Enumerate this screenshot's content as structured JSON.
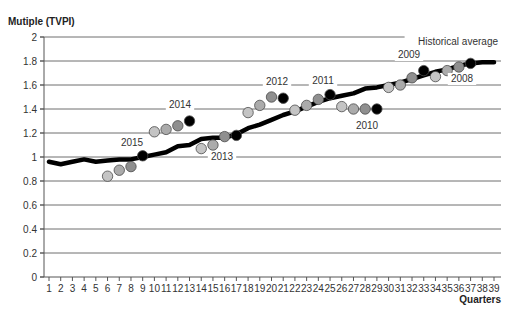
{
  "chart_data": {
    "type": "line",
    "title": "",
    "ylabel": "Mutiple (TVPI)",
    "xlabel": "Quarters",
    "ylim": [
      0,
      2
    ],
    "yticks": [
      "0",
      "0.2",
      "0.4",
      "0.6",
      "0.8",
      "1",
      "1.2",
      "1.4",
      "1.6",
      "1.8",
      "2"
    ],
    "ytick_values": [
      0,
      0.2,
      0.4,
      0.6,
      0.8,
      1.0,
      1.2,
      1.4,
      1.6,
      1.8,
      2.0
    ],
    "x": [
      1,
      2,
      3,
      4,
      5,
      6,
      7,
      8,
      9,
      10,
      11,
      12,
      13,
      14,
      15,
      16,
      17,
      18,
      19,
      20,
      21,
      22,
      23,
      24,
      25,
      26,
      27,
      28,
      29,
      30,
      31,
      32,
      33,
      34,
      35,
      36,
      37,
      38,
      39
    ],
    "grid": true,
    "series": [
      {
        "name": "Historical average",
        "style": "line",
        "color": "#000000",
        "values": [
          0.96,
          0.94,
          0.96,
          0.98,
          0.96,
          0.97,
          0.98,
          0.98,
          1.0,
          1.02,
          1.04,
          1.09,
          1.1,
          1.15,
          1.16,
          1.16,
          1.19,
          1.24,
          1.27,
          1.31,
          1.35,
          1.38,
          1.42,
          1.46,
          1.49,
          1.51,
          1.53,
          1.57,
          1.58,
          1.6,
          1.62,
          1.65,
          1.68,
          1.71,
          1.73,
          1.76,
          1.78,
          1.79,
          1.79
        ]
      },
      {
        "name": "2015",
        "style": "dots",
        "x": [
          6,
          7,
          8,
          9
        ],
        "values": [
          0.84,
          0.89,
          0.92,
          1.01
        ]
      },
      {
        "name": "2014",
        "style": "dots",
        "x": [
          10,
          11,
          12,
          13
        ],
        "values": [
          1.21,
          1.23,
          1.26,
          1.3
        ]
      },
      {
        "name": "2013",
        "style": "dots",
        "x": [
          14,
          15,
          16,
          17
        ],
        "values": [
          1.07,
          1.1,
          1.17,
          1.18
        ]
      },
      {
        "name": "2012",
        "style": "dots",
        "x": [
          18,
          19,
          20,
          21
        ],
        "values": [
          1.37,
          1.43,
          1.5,
          1.49
        ]
      },
      {
        "name": "2011",
        "style": "dots",
        "x": [
          22,
          23,
          24,
          25
        ],
        "values": [
          1.39,
          1.43,
          1.48,
          1.52
        ]
      },
      {
        "name": "2010",
        "style": "dots",
        "x": [
          26,
          27,
          28,
          29
        ],
        "values": [
          1.42,
          1.4,
          1.4,
          1.4
        ]
      },
      {
        "name": "2009",
        "style": "dots",
        "x": [
          30,
          31,
          32,
          33
        ],
        "values": [
          1.58,
          1.6,
          1.66,
          1.72
        ]
      },
      {
        "name": "2008",
        "style": "dots",
        "x": [
          34,
          35,
          36,
          37
        ],
        "values": [
          1.67,
          1.72,
          1.75,
          1.78
        ]
      }
    ],
    "dot_colors": [
      "#c4c4c4",
      "#ababab",
      "#8f8f8f",
      "#000000"
    ],
    "annotations": [
      {
        "text": "Historical average",
        "x": 458,
        "y": 45
      },
      {
        "text": "2015",
        "x": 132,
        "y": 146
      },
      {
        "text": "2014",
        "x": 180,
        "y": 108
      },
      {
        "text": "2013",
        "x": 222,
        "y": 160
      },
      {
        "text": "2012",
        "x": 277,
        "y": 85
      },
      {
        "text": "2011",
        "x": 323,
        "y": 84
      },
      {
        "text": "2010",
        "x": 367,
        "y": 129
      },
      {
        "text": "2009",
        "x": 409,
        "y": 58
      },
      {
        "text": "2008",
        "x": 462,
        "y": 82
      }
    ],
    "legend_position": "inline"
  }
}
